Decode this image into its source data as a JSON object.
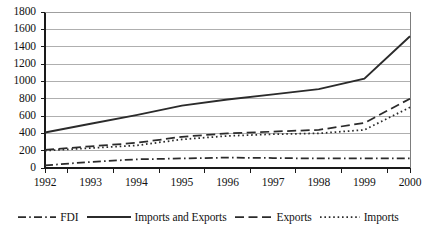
{
  "chart_data": {
    "type": "line",
    "title": "",
    "subtitle": "",
    "xlabel": "",
    "ylabel": "",
    "categories": [
      "1992",
      "1993",
      "1994",
      "1995",
      "1996",
      "1997",
      "1998",
      "1999",
      "2000"
    ],
    "x": [
      1992,
      1993,
      1994,
      1995,
      1996,
      1997,
      1998,
      1999,
      2000
    ],
    "ylim": [
      0,
      1800
    ],
    "xlim": [
      1992,
      2000
    ],
    "ytick_labels": [
      "0",
      "200",
      "400",
      "600",
      "800",
      "1000",
      "1200",
      "1400",
      "1600",
      "1800"
    ],
    "yticks": [
      0,
      200,
      400,
      600,
      800,
      1000,
      1200,
      1400,
      1600,
      1800
    ],
    "grid": "horizontal",
    "legend_position": "bottom",
    "series": [
      {
        "name": "FDI",
        "style": "dash-dot",
        "color": "#2b2b2b",
        "values": [
          30,
          70,
          100,
          110,
          120,
          115,
          110,
          110,
          110
        ]
      },
      {
        "name": "Imports and Exports",
        "style": "solid",
        "color": "#2b2b2b",
        "values": [
          410,
          510,
          610,
          720,
          790,
          850,
          910,
          1030,
          1520
        ]
      },
      {
        "name": "Exports",
        "style": "dashed",
        "color": "#2b2b2b",
        "values": [
          210,
          250,
          290,
          360,
          400,
          420,
          440,
          520,
          800
        ]
      },
      {
        "name": "Imports",
        "style": "dotted",
        "color": "#2b2b2b",
        "values": [
          200,
          230,
          260,
          330,
          370,
          390,
          400,
          440,
          700
        ]
      }
    ]
  },
  "legend": {
    "entries": [
      {
        "label": "FDI"
      },
      {
        "label": "Imports and Exports"
      },
      {
        "label": "Exports"
      },
      {
        "label": "Imports"
      }
    ]
  },
  "axes": {
    "grid_color": "#9b9b9b",
    "axis_color": "#1a1a1a"
  }
}
